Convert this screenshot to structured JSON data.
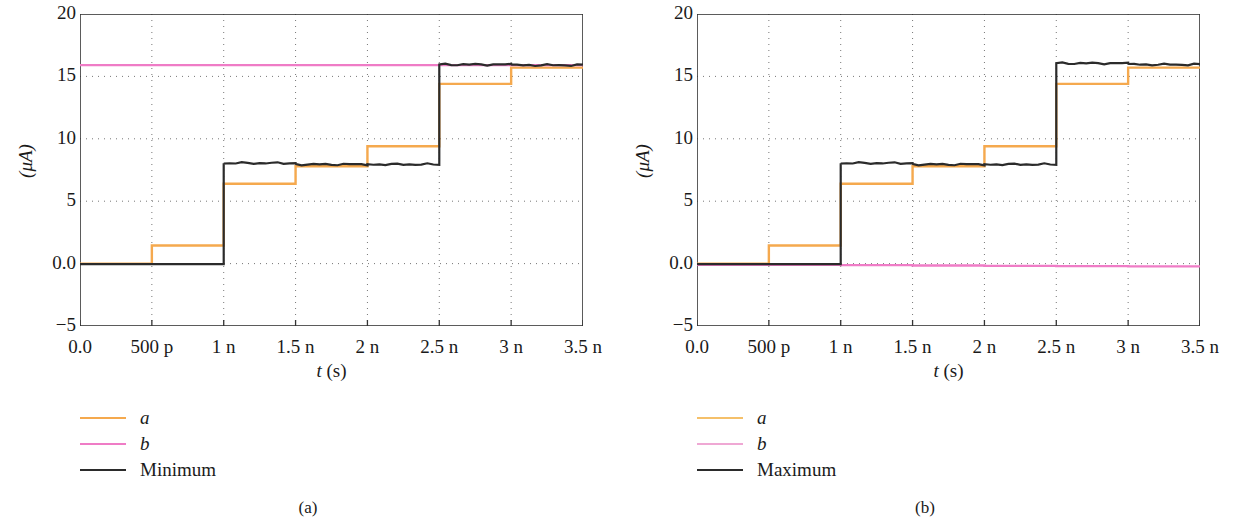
{
  "figure": {
    "panels": [
      {
        "caption": "(a)",
        "ylabel": "(μA)",
        "xlabel_var": "t",
        "xlabel_unit": "(s)",
        "yticks": [
          "20",
          "15",
          "10",
          "5",
          "0.0",
          "−5"
        ],
        "ytick_values": [
          20,
          15,
          10,
          5,
          0,
          -5
        ],
        "xticks": [
          "0.0",
          "500 p",
          "1 n",
          "1.5 n",
          "2 n",
          "2.5 n",
          "3 n",
          "3.5 n"
        ],
        "xtick_values": [
          0,
          0.5,
          1,
          1.5,
          2,
          2.5,
          3,
          3.5
        ],
        "legend": [
          {
            "label": "a",
            "color": "#f5a94e",
            "italic": true,
            "width": 2
          },
          {
            "label": "b",
            "color": "#ef7cc6",
            "italic": true,
            "width": 2
          },
          {
            "label": "Minimum",
            "color": "#2b2b2b",
            "italic": false,
            "width": 2.6
          }
        ]
      },
      {
        "caption": "(b)",
        "ylabel": "(μA)",
        "xlabel_var": "t",
        "xlabel_unit": "(s)",
        "yticks": [
          "20",
          "15",
          "10",
          "5",
          "0.0",
          "−5"
        ],
        "ytick_values": [
          20,
          15,
          10,
          5,
          0,
          -5
        ],
        "xticks": [
          "0.0",
          "500 p",
          "1 n",
          "1.5 n",
          "2 n",
          "2.5 n",
          "3 n",
          "3.5 n"
        ],
        "xtick_values": [
          0,
          0.5,
          1,
          1.5,
          2,
          2.5,
          3,
          3.5
        ],
        "legend": [
          {
            "label": "a",
            "color": "#f5c06a",
            "italic": true,
            "width": 2
          },
          {
            "label": "b",
            "color": "#efa8d4",
            "italic": true,
            "width": 2
          },
          {
            "label": "Maximum",
            "color": "#2b2b2b",
            "italic": false,
            "width": 2.6
          }
        ]
      }
    ]
  },
  "chart_data": [
    {
      "type": "line",
      "title": "(a)",
      "xlabel": "t (s)",
      "ylabel": "(μA)",
      "xlim": [
        0,
        3.5
      ],
      "ylim": [
        -5,
        20
      ],
      "x_unit": "s",
      "y_unit": "μA",
      "grid": true,
      "grid_style": "dotted",
      "legend_position": "below-left",
      "step_style": "post",
      "x_breakpoints": [
        0,
        0.5,
        1.0,
        1.5,
        2.0,
        2.5,
        3.0,
        3.5
      ],
      "series": [
        {
          "name": "a",
          "color": "#f5a94e",
          "step_values": [
            0.0,
            1.45,
            6.4,
            7.8,
            9.4,
            14.4,
            15.7,
            15.8
          ],
          "note": "orange staircase rising across the sweep"
        },
        {
          "name": "b",
          "color": "#ef7cc6",
          "step_values": [
            15.9,
            15.9,
            15.9,
            15.9,
            15.9,
            15.9,
            15.9,
            15.9
          ],
          "note": "flat pink line held near 15.9 uA"
        },
        {
          "name": "Minimum",
          "color": "#2b2b2b",
          "step_values": [
            -0.05,
            -0.05,
            8.05,
            7.95,
            7.95,
            15.95,
            15.9,
            15.9
          ],
          "note": "dark staircase, two large steps at 1 n and 2.5 n"
        }
      ]
    },
    {
      "type": "line",
      "title": "(b)",
      "xlabel": "t (s)",
      "ylabel": "(μA)",
      "xlim": [
        0,
        3.5
      ],
      "ylim": [
        -5,
        20
      ],
      "x_unit": "s",
      "y_unit": "μA",
      "grid": true,
      "grid_style": "dotted",
      "legend_position": "below-left",
      "step_style": "post",
      "x_breakpoints": [
        0,
        0.5,
        1.0,
        1.5,
        2.0,
        2.5,
        3.0,
        3.5
      ],
      "series": [
        {
          "name": "a",
          "color": "#f5a94e",
          "step_values": [
            0.0,
            1.45,
            6.4,
            7.8,
            9.4,
            14.4,
            15.7,
            15.8
          ],
          "note": "orange staircase identical to panel (a)"
        },
        {
          "name": "b",
          "color": "#ef7cc6",
          "step_values": [
            -0.1,
            -0.1,
            -0.12,
            -0.15,
            -0.18,
            -0.2,
            -0.22,
            -0.25
          ],
          "note": "flat pink line held near 0 uA, visible from 1 n onward"
        },
        {
          "name": "Maximum",
          "color": "#2b2b2b",
          "step_values": [
            -0.05,
            -0.05,
            8.05,
            7.95,
            7.95,
            16.05,
            15.95,
            15.95
          ],
          "note": "dark staircase, two large steps at 1 n and 2.5 n"
        }
      ]
    }
  ]
}
